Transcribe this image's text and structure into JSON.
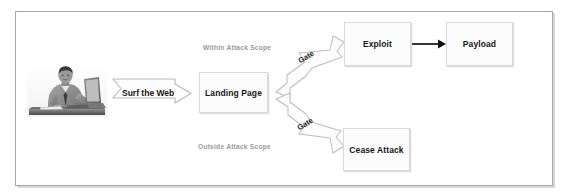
{
  "diagram": {
    "frame": {
      "border_color": "#a9a9ad",
      "background": "#ffffff"
    },
    "actor": {
      "name": "user-at-computer-photo",
      "alt": "Man sitting at a desk typing on a laptop"
    },
    "connectors": {
      "surf": {
        "label": "Surf the Web",
        "style": "block-arrow-outline",
        "color": "#b8b8bc"
      },
      "gate_top": {
        "label": "Gate",
        "style": "branch-arrow-outline",
        "color": "#b8b8bc"
      },
      "gate_bottom": {
        "label": "Gate",
        "style": "branch-arrow-outline",
        "color": "#b8b8bc"
      },
      "exploit_to_payload": {
        "label": "",
        "style": "solid-arrow",
        "color": "#111111"
      }
    },
    "scope_labels": {
      "within": "Within Attack Scope",
      "outside": "Outside Attack Scope",
      "color": "#9a9a9e"
    },
    "nodes": [
      {
        "id": "landing-page",
        "label": "Landing Page"
      },
      {
        "id": "exploit",
        "label": "Exploit"
      },
      {
        "id": "payload",
        "label": "Payload"
      },
      {
        "id": "cease-attack",
        "label": "Cease Attack"
      }
    ],
    "node_style": {
      "fill": "#fcfcfc",
      "border": "#d9d9dd",
      "text": "#161616"
    }
  }
}
